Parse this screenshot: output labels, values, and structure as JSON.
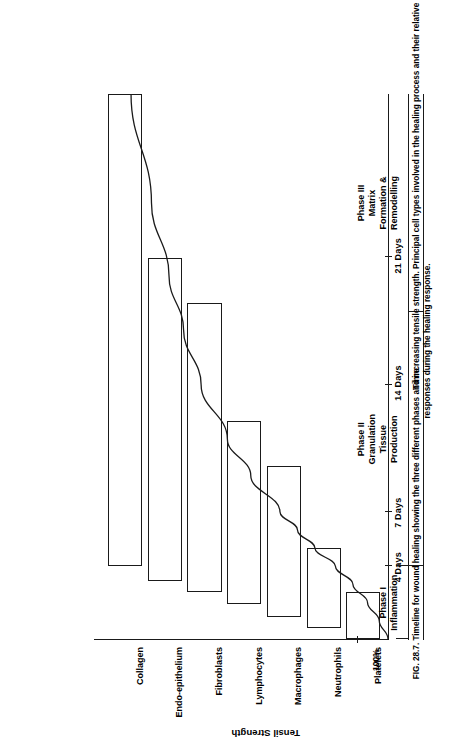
{
  "figure": {
    "number": "FIG. 28.7.",
    "caption": "Timeline for wound healing showing the three different phases and increasing tensile strength. Principal cell types involved in the healing process and their relative responses during the healing response."
  },
  "axes": {
    "x_title": "Time",
    "y_title": "Tensil Strength",
    "y_max_label": "100%",
    "x_ticks": [
      {
        "label": "4 Days",
        "days": 4
      },
      {
        "label": "7 Days",
        "days": 7
      },
      {
        "label": "14 Days",
        "days": 14
      },
      {
        "label": "21 Days",
        "days": 21
      }
    ]
  },
  "cell_types": [
    {
      "label": "Collagen",
      "start_days": 4.0,
      "end_days": 30.0
    },
    {
      "label": "Endo-epithelium",
      "start_days": 3.2,
      "end_days": 21.0
    },
    {
      "label": "Fibroblasts",
      "start_days": 2.6,
      "end_days": 18.5
    },
    {
      "label": "Lymphocytes",
      "start_days": 1.9,
      "end_days": 12.0
    },
    {
      "label": "Macrophages",
      "start_days": 1.2,
      "end_days": 9.5
    },
    {
      "label": "Neutrophils",
      "start_days": 0.6,
      "end_days": 5.0
    },
    {
      "label": "Platelets",
      "start_days": 0.0,
      "end_days": 2.6
    }
  ],
  "phases": [
    {
      "lines": [
        "Phase I",
        "Inflammation"
      ],
      "start_days": 0,
      "end_days": 4
    },
    {
      "lines": [
        "Phase II",
        "Granulation",
        "Tissue",
        "Production"
      ],
      "start_days": 4,
      "end_days": 18
    },
    {
      "lines": [
        "Phase III",
        "Matrix",
        "Formation &",
        "Remodelling"
      ],
      "start_days": 18,
      "end_days": 30
    }
  ],
  "chart_data": {
    "type": "line",
    "title": "Timeline for wound healing",
    "xlabel": "Time",
    "ylabel": "Tensil Strength",
    "xlim": [
      0,
      30
    ],
    "ylim": [
      0,
      100
    ],
    "grid": false,
    "legend": "none",
    "x_tick_labels": [
      "4 Days",
      "7 Days",
      "14 Days",
      "21 Days"
    ],
    "x_tick_values": [
      4,
      7,
      14,
      21
    ],
    "y_tick_labels": [
      "100%"
    ],
    "series": [
      {
        "name": "Tensile strength",
        "x": [
          0,
          1,
          2,
          3,
          4,
          5,
          6,
          7,
          9,
          11,
          14,
          17,
          20,
          24,
          30
        ],
        "y": [
          0,
          3,
          7,
          12,
          18,
          25,
          31,
          37,
          47,
          55,
          64,
          70,
          75,
          81,
          88
        ]
      }
    ],
    "bars": {
      "orientation": "horizontal",
      "categories": [
        "Collagen",
        "Endo-epithelium",
        "Fibroblasts",
        "Lymphocytes",
        "Macrophages",
        "Neutrophils",
        "Platelets"
      ],
      "spans_days": [
        [
          4,
          30
        ],
        [
          3.2,
          21
        ],
        [
          2.6,
          18.5
        ],
        [
          1.9,
          12
        ],
        [
          1.2,
          9.5
        ],
        [
          0.6,
          5
        ],
        [
          0,
          2.6
        ]
      ]
    },
    "annotations": [
      "Phase I Inflammation",
      "Phase II Granulation Tissue Production",
      "Phase III Matrix Formation & Remodelling"
    ]
  }
}
